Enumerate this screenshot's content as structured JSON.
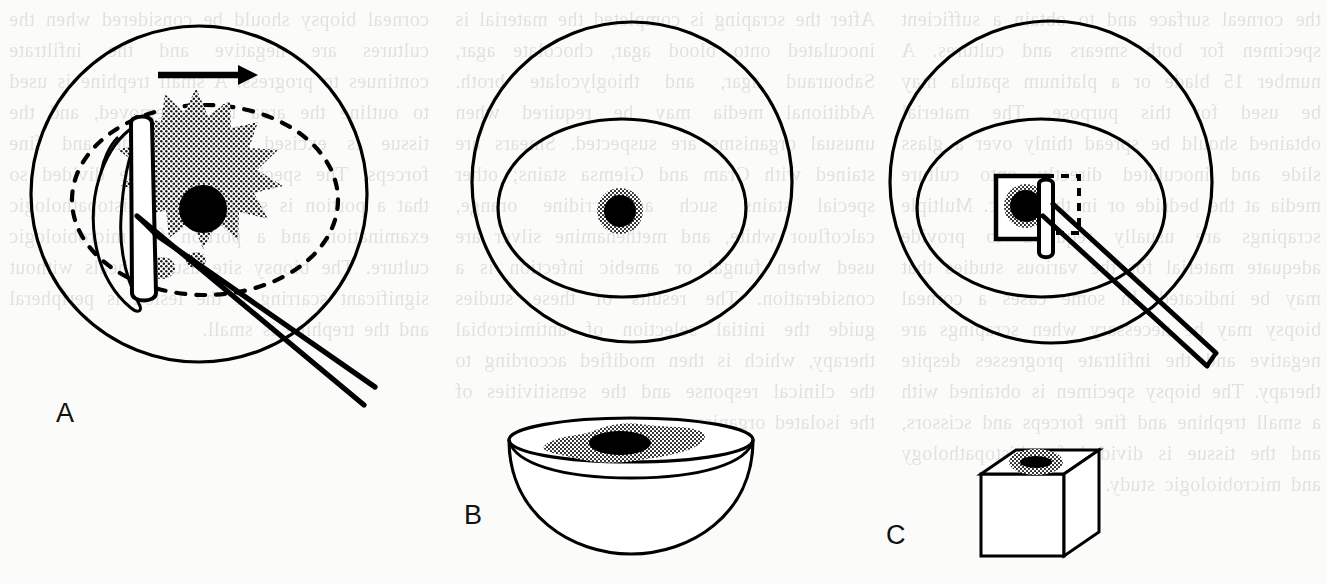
{
  "figure": {
    "kind": "line-art-medical-illustration",
    "title_visible": false,
    "background_color": "#fbfbf9",
    "ink_color": "#000000",
    "stipple_color": "#555555",
    "panels": [
      {
        "id": "A",
        "label": "A",
        "label_x": 56,
        "label_y": 398,
        "description_parts": [
          "outer-circle-globe",
          "dashed-inner-ellipse",
          "stippled-starburst-lesion",
          "solid-black-lesion-core",
          "vertical-blade",
          "diagonal-instrument-handle",
          "peeled-tissue-flap",
          "direction-arrow"
        ],
        "arrow": {
          "label": "direction-arrow",
          "x1": 158,
          "y1": 75,
          "x2": 248,
          "y2": 75,
          "points": "right"
        }
      },
      {
        "id": "B",
        "label": "B",
        "label_x": 464,
        "label_y": 500,
        "description_parts": [
          "outer-circle-globe",
          "inner-ellipse-cornea",
          "stippled-ring-lesion",
          "solid-black-lesion-core",
          "culture-dish-bowl",
          "stippled-smear-in-bowl"
        ]
      },
      {
        "id": "C",
        "label": "C",
        "label_x": 886,
        "label_y": 520,
        "description_parts": [
          "outer-circle-globe",
          "inner-ellipse-cornea",
          "solid-square-tissue-block",
          "dashed-square-outline",
          "stippled-ring-lesion",
          "solid-black-lesion-core",
          "vertical-blade",
          "diagonal-instrument-handle",
          "paraffin-cube-specimen",
          "stippled-ellipse-on-cube"
        ]
      }
    ]
  },
  "ghost_text": {
    "note": "faint mirrored show-through text from the reverse side of the scanned page",
    "column_1": "the corneal surface and to obtain a sufficient specimen for both smears and cultures. A number 15 blade or a platinum spatula may be used for this purpose. The material obtained should be spread thinly over a glass slide and inoculated directly onto culture media at the bedside or in the clinic. Multiple scrapings are usually required to provide adequate material for the various studies that may be indicated. In some cases a corneal biopsy may be necessary when scrapings are negative and the infiltrate progresses despite therapy. The biopsy specimen is obtained with a small trephine and fine forceps and scissors, and the tissue is divided for histopathology and microbiologic study.",
    "column_2": "After the scraping is completed the material is inoculated onto blood agar, chocolate agar, Sabouraud agar, and thioglycolate broth. Additional media may be required when unusual organisms are suspected. Smears are stained with Gram and Giemsa stains; other special stains such as acridine orange, calcofluor white, and methenamine silver are used when fungal or amebic infection is a consideration. The results of these studies guide the initial selection of antimicrobial therapy, which is then modified according to the clinical response and the sensitivities of the isolated organism.",
    "column_3": "corneal biopsy should be considered when the cultures are negative and the infiltrate continues to progress. A small trephine is used to outline the area to be removed, and the tissue is excised with a blade and fine forceps. The specimen should be divided so that a portion is submitted for histopathologic examination and a portion for microbiologic culture. The biopsy site usually heals without significant scarring if the lesion is peripheral and the trephine is small."
  }
}
